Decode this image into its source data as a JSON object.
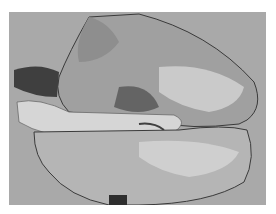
{
  "image": {
    "description": "Grayscale photograph of an excised lung specimen on a gray background",
    "colors": {
      "background": "#a9a9a9",
      "frame": "#ffffff",
      "tissue_light": "#cfcfcf",
      "tissue_mid": "#9a9a9a",
      "tissue_dark": "#4a4a4a"
    }
  }
}
